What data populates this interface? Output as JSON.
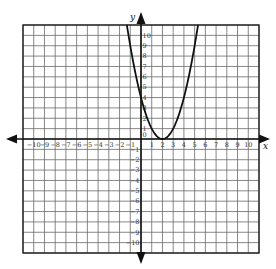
{
  "chart_data": {
    "type": "line",
    "title": "",
    "xlabel": "x",
    "ylabel": "y",
    "xlim": [
      -11,
      11
    ],
    "ylim": [
      -11,
      11
    ],
    "grid": true,
    "x_ticks": [
      -10,
      -9,
      -8,
      -7,
      -6,
      -5,
      -4,
      -3,
      -2,
      -1,
      1,
      2,
      3,
      4,
      5,
      6,
      7,
      8,
      9,
      10
    ],
    "y_ticks": [
      10,
      9,
      8,
      7,
      6,
      5,
      4,
      3,
      2,
      1,
      0,
      -1,
      -2,
      -3,
      -4,
      -5,
      -6,
      -7,
      -8,
      -9,
      -10
    ],
    "series": [
      {
        "name": "parabola",
        "equation": "y = (x - 2)^2",
        "vertex": [
          2,
          0
        ],
        "x": [
          -1.3,
          -1,
          0,
          1,
          2,
          3,
          4,
          5,
          5.3
        ],
        "y": [
          10.9,
          9,
          4,
          1,
          0,
          1,
          4,
          9,
          10.9
        ]
      }
    ],
    "legend": null
  },
  "layout": {
    "grid_left": 23,
    "grid_top": 25,
    "grid_right": 259,
    "grid_bottom": 253
  },
  "labels": {
    "x_axis": "x",
    "y_axis": "y"
  }
}
